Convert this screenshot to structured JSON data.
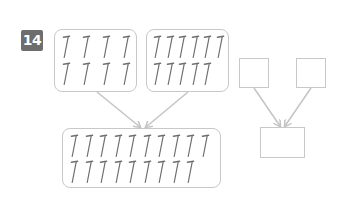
{
  "problem": {
    "number_label": "14",
    "badge_color": "#6d6d6d"
  },
  "colors": {
    "box_border": "#c8c8c8",
    "arrow": "#c4c4c4",
    "nail": "#6f6f6f"
  },
  "left_diagram": {
    "group_a": {
      "icon": "nail-icon",
      "rows": [
        4,
        4
      ],
      "count": 8
    },
    "group_b": {
      "icon": "nail-icon",
      "rows": [
        6,
        5
      ],
      "count": 11
    },
    "total": {
      "icon": "nail-icon",
      "rows": [
        10,
        9
      ],
      "count": 19
    }
  },
  "right_diagram": {
    "addend_a": "",
    "addend_b": "",
    "sum": ""
  }
}
